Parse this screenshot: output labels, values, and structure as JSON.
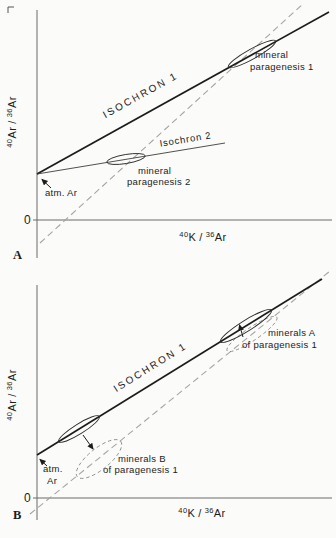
{
  "figure": {
    "colors": {
      "background": "#fbfbf9",
      "isochron_line": "#1c1c1c",
      "thin_isochron_line": "#3d3d3d",
      "dashed_reference_line": "#a3a3a3",
      "axis": "#6b6b6b",
      "text": "#1c1c1c"
    },
    "panel_a": {
      "letter": "A",
      "origin_label": "0",
      "y_axis_label": {
        "sup1": "40",
        "base1": "Ar",
        "sep": "/",
        "sup2": "36",
        "base2": "Ar"
      },
      "x_axis_label": {
        "sup1": "40",
        "base1": "K",
        "sep": "/",
        "sup2": "36",
        "base2": "Ar"
      },
      "isochron1_label": "ISOCHRON 1",
      "isochron2_label": "Isochron 2",
      "paragenesis1_label": {
        "line1": "mineral",
        "line2": "paragenesis 1"
      },
      "paragenesis2_label": {
        "line1": "mineral",
        "line2": "paragenesis 2"
      },
      "atm_ar_label": "atm. Ar"
    },
    "panel_b": {
      "letter": "B",
      "origin_label": "0",
      "y_axis_label": {
        "sup1": "40",
        "base1": "Ar",
        "sep": "/",
        "sup2": "36",
        "base2": "Ar"
      },
      "x_axis_label": {
        "sup1": "40",
        "base1": "K",
        "sep": "/",
        "sup2": "36",
        "base2": "Ar"
      },
      "isochron1_label": "ISOCHRON 1",
      "minerals_a_label": {
        "line1": "minerals A",
        "line2": "of paragenesis 1"
      },
      "minerals_b_label": {
        "line1": "minerals B",
        "line2": "of paragenesis 1"
      },
      "atm_ar_label": {
        "line1": "atm.",
        "line2": "Ar"
      }
    }
  }
}
